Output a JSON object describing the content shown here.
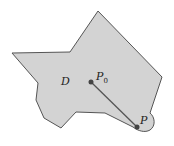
{
  "diagram": {
    "region_label": "D",
    "point_start_label": "P",
    "point_start_subscript": "0",
    "point_end_label": "P",
    "colors": {
      "region_fill": "#d3d3d3",
      "region_stroke": "#555555",
      "segment": "#555555",
      "point": "#444444"
    }
  }
}
